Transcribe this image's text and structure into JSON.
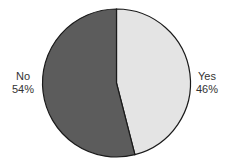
{
  "chart_data": {
    "type": "pie",
    "title": "",
    "categories": [
      "Yes",
      "No"
    ],
    "values": [
      46,
      54
    ],
    "labels": [
      "Yes\n46%",
      "No\n54%"
    ],
    "colors": [
      "#e4e4e4",
      "#5c5c5c"
    ],
    "start_angle": "top, clockwise",
    "legend": "none (inline labels)"
  },
  "labels": {
    "yes": {
      "name": "Yes",
      "pct": "46%"
    },
    "no": {
      "name": "No",
      "pct": "54%"
    }
  }
}
